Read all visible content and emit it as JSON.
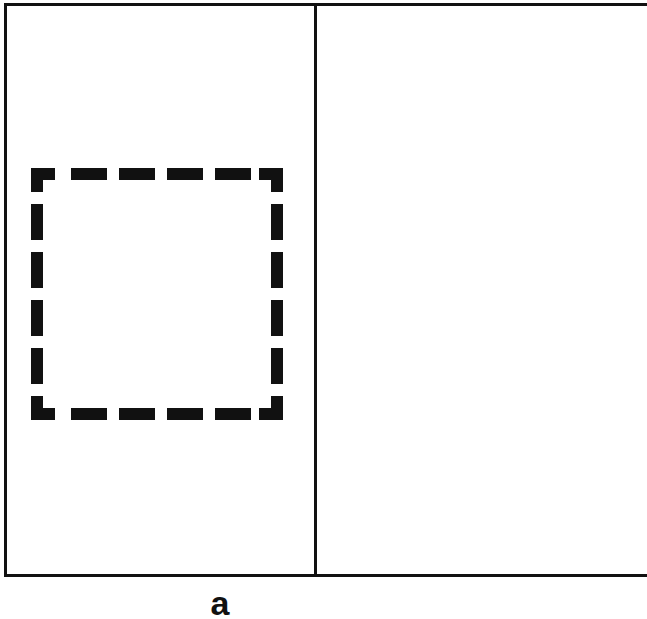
{
  "diagram": {
    "frame": {
      "stroke_color": "#111111",
      "stroke_width": 3
    },
    "panels": [
      {
        "name": "left",
        "content": "dashed-square"
      },
      {
        "name": "right",
        "content": "empty"
      }
    ],
    "dashed_square": {
      "stroke_color": "#111111",
      "stroke_width": 12,
      "dashes_per_side": 6
    },
    "caption": {
      "text": "a"
    }
  }
}
